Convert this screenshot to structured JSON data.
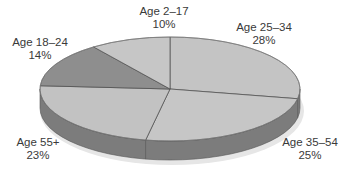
{
  "chart_data": {
    "type": "pie",
    "style": "3d-tilted",
    "title": "",
    "categories": [
      "Age 2–17",
      "Age 25–34",
      "Age 35–54",
      "Age 55+",
      "Age 18–24"
    ],
    "values": [
      10,
      28,
      25,
      23,
      14
    ],
    "unit": "%",
    "labels": [
      {
        "name": "Age 2–17",
        "pct": "10%"
      },
      {
        "name": "Age 25–34",
        "pct": "28%"
      },
      {
        "name": "Age 35–54",
        "pct": "25%"
      },
      {
        "name": "Age 55+",
        "pct": "23%"
      },
      {
        "name": "Age 18–24",
        "pct": "14%"
      }
    ],
    "slice_order_clockwise_from_top": [
      "Age 25–34",
      "Age 35–54",
      "Age 55+",
      "Age 18–24",
      "Age 2–17"
    ],
    "colors": {
      "Age 2–17": "#c6c6c6",
      "Age 25–34": "#c4c4c4",
      "Age 35–54": "#c6c6c6",
      "Age 55+": "#c2c2c2",
      "Age 18–24": "#8e8e8e",
      "side": "#7c7c7c",
      "edge": "#555555"
    },
    "legend": "none (direct labels)"
  }
}
